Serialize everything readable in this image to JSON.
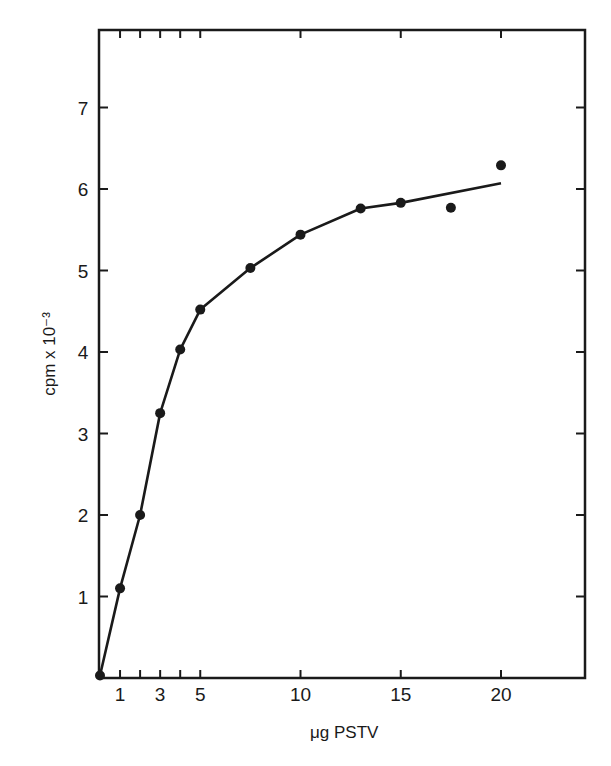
{
  "chart_data": {
    "type": "line",
    "title": "",
    "xlabel": "μg PSTV",
    "ylabel": "cpm x 10⁻³",
    "xlim": [
      0,
      24
    ],
    "ylim": [
      0,
      8
    ],
    "x_ticks": [
      1,
      2,
      3,
      4,
      5,
      10,
      15,
      20
    ],
    "x_tick_labels": [
      "1",
      "",
      "3",
      "",
      "5",
      "10",
      "15",
      "20"
    ],
    "y_ticks": [
      1,
      2,
      3,
      4,
      5,
      6,
      7
    ],
    "y_tick_labels": [
      "1",
      "2",
      "3",
      "4",
      "5",
      "6",
      "7"
    ],
    "grid": false,
    "legend": null,
    "series": [
      {
        "name": "measured",
        "style": "markers",
        "x": [
          0,
          1,
          2,
          3,
          4,
          5,
          7.5,
          10,
          13,
          15,
          17.5,
          20
        ],
        "y": [
          0.03,
          1.1,
          2.0,
          3.25,
          4.03,
          4.52,
          5.03,
          5.44,
          5.76,
          5.83,
          5.77,
          6.29
        ]
      },
      {
        "name": "fitted curve",
        "style": "line",
        "x": [
          0,
          1,
          2,
          3,
          4,
          5,
          7.5,
          10,
          13,
          15,
          20
        ],
        "y": [
          0.03,
          1.1,
          2.0,
          3.25,
          4.03,
          4.52,
          5.03,
          5.44,
          5.76,
          5.83,
          6.07
        ]
      }
    ]
  },
  "colors": {
    "ink": "#1a1a1a",
    "background": "#ffffff"
  }
}
